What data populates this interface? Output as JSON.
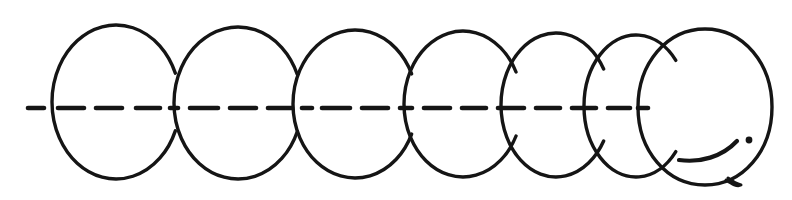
{
  "figure": {
    "title": "Rolling circle motion sequence",
    "background_color": "#ffffff",
    "ink_color": "#151515",
    "canvas": {
      "width": 792,
      "height": 200
    },
    "stroke_width": 3.4
  },
  "axis": {
    "name": "dashed-centerline",
    "y": 108,
    "x_start": 28,
    "x_end": 648,
    "stroke_width": 4.6,
    "dash_pattern": "18 13",
    "dash_segments": [
      {
        "x1": 28,
        "x2": 44
      },
      {
        "x1": 58,
        "x2": 84
      },
      {
        "x1": 96,
        "x2": 122
      },
      {
        "x1": 136,
        "x2": 160
      },
      {
        "x1": 170,
        "x2": 178
      },
      {
        "x1": 190,
        "x2": 218
      },
      {
        "x1": 230,
        "x2": 256
      },
      {
        "x1": 268,
        "x2": 292
      },
      {
        "x1": 302,
        "x2": 312
      },
      {
        "x1": 322,
        "x2": 350
      },
      {
        "x1": 362,
        "x2": 388
      },
      {
        "x1": 400,
        "x2": 412
      },
      {
        "x1": 424,
        "x2": 450
      },
      {
        "x1": 462,
        "x2": 486
      },
      {
        "x1": 498,
        "x2": 524
      },
      {
        "x1": 536,
        "x2": 560
      },
      {
        "x1": 572,
        "x2": 596
      },
      {
        "x1": 608,
        "x2": 630
      },
      {
        "x1": 638,
        "x2": 648
      }
    ]
  },
  "circles": [
    {
      "index": 1,
      "label": "circle-1",
      "cx": 116,
      "cy": 102,
      "rx": 64,
      "ry": 77,
      "closed": false,
      "gap_top_deg": -30,
      "gap_bottom_deg": 30,
      "arc_start_deg": -22,
      "arc_end_deg": 22
    },
    {
      "index": 2,
      "label": "circle-2",
      "cx": 238,
      "cy": 103,
      "rx": 64,
      "ry": 76,
      "closed": false,
      "gap_top_deg": -30,
      "gap_bottom_deg": 30,
      "arc_start_deg": -22,
      "arc_end_deg": 22
    },
    {
      "index": 3,
      "label": "circle-3",
      "cx": 355,
      "cy": 104,
      "rx": 62,
      "ry": 74,
      "closed": false,
      "gap_top_deg": -30,
      "gap_bottom_deg": 30,
      "arc_start_deg": -24,
      "arc_end_deg": 24
    },
    {
      "index": 4,
      "label": "circle-4",
      "cx": 463,
      "cy": 104,
      "rx": 59,
      "ry": 73,
      "closed": false,
      "gap_top_deg": -32,
      "gap_bottom_deg": 32,
      "arc_start_deg": -26,
      "arc_end_deg": 26
    },
    {
      "index": 5,
      "label": "circle-5",
      "cx": 556,
      "cy": 105,
      "rx": 55,
      "ry": 72,
      "closed": false,
      "gap_top_deg": -34,
      "gap_bottom_deg": 34,
      "arc_start_deg": -30,
      "arc_end_deg": 30
    },
    {
      "index": 6,
      "label": "circle-6",
      "cx": 636,
      "cy": 106,
      "rx": 52,
      "ry": 71,
      "closed": false,
      "gap_top_deg": -38,
      "gap_bottom_deg": 38,
      "arc_start_deg": -40,
      "arc_end_deg": 40
    },
    {
      "index": 7,
      "label": "circle-7-closed",
      "cx": 705,
      "cy": 107,
      "rx": 67,
      "ry": 78,
      "closed": true,
      "gap_top_deg": null,
      "gap_bottom_deg": null,
      "arc_start_deg": null,
      "arc_end_deg": null
    }
  ],
  "details": [
    {
      "name": "inner-hook-arc",
      "type": "arc",
      "note": "short curved stroke inside lower-right of the final closed circle"
    },
    {
      "name": "ink-dot",
      "type": "dot",
      "cx": 749,
      "cy": 140,
      "r": 3.4,
      "note": "small solid dot at right of final circle interior"
    },
    {
      "name": "bottom-tail",
      "type": "stroke",
      "note": "small pointed tail overlapping the bottom-right edge of the final circle"
    }
  ],
  "counts": {
    "circle_count": 7,
    "open_arc_count": 6,
    "closed_circle_count": 1
  }
}
